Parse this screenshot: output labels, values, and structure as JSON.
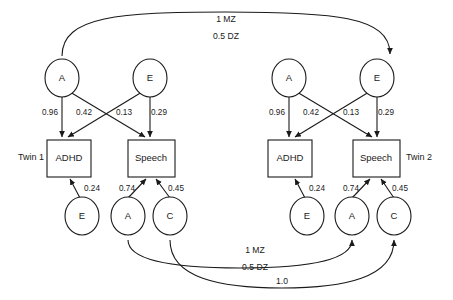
{
  "diagram": {
    "twins": [
      {
        "id": "twin1",
        "label": "Twin 1",
        "top_latents": [
          {
            "name": "A",
            "label": "A"
          },
          {
            "name": "E",
            "label": "E"
          }
        ],
        "observed": [
          {
            "name": "adhd",
            "label": "ADHD"
          },
          {
            "name": "speech",
            "label": "Speech"
          }
        ],
        "bottom_latents": [
          {
            "name": "E",
            "label": "E"
          },
          {
            "name": "A",
            "label": "A"
          },
          {
            "name": "C",
            "label": "C"
          }
        ],
        "top_paths": [
          {
            "from": "A",
            "to": "ADHD",
            "coefficient": "0.96"
          },
          {
            "from": "A",
            "to": "Speech",
            "coefficient": "0.42"
          },
          {
            "from": "E",
            "to": "ADHD",
            "coefficient": "0.13"
          },
          {
            "from": "E",
            "to": "Speech",
            "coefficient": "0.29"
          }
        ],
        "bottom_paths": [
          {
            "from": "E",
            "to": "ADHD",
            "coefficient": "0.24"
          },
          {
            "from": "A",
            "to": "Speech",
            "coefficient": "0.74"
          },
          {
            "from": "C",
            "to": "Speech",
            "coefficient": "0.45"
          }
        ]
      },
      {
        "id": "twin2",
        "label": "Twin 2",
        "top_latents": [
          {
            "name": "A",
            "label": "A"
          },
          {
            "name": "E",
            "label": "E"
          }
        ],
        "observed": [
          {
            "name": "adhd",
            "label": "ADHD"
          },
          {
            "name": "speech",
            "label": "Speech"
          }
        ],
        "bottom_latents": [
          {
            "name": "E",
            "label": "E"
          },
          {
            "name": "A",
            "label": "A"
          },
          {
            "name": "C",
            "label": "C"
          }
        ],
        "top_paths": [
          {
            "from": "A",
            "to": "ADHD",
            "coefficient": "0.96"
          },
          {
            "from": "A",
            "to": "Speech",
            "coefficient": "0.42"
          },
          {
            "from": "E",
            "to": "ADHD",
            "coefficient": "0.13"
          },
          {
            "from": "E",
            "to": "Speech",
            "coefficient": "0.29"
          }
        ],
        "bottom_paths": [
          {
            "from": "E",
            "to": "ADHD",
            "coefficient": "0.24"
          },
          {
            "from": "A",
            "to": "Speech",
            "coefficient": "0.74"
          },
          {
            "from": "C",
            "to": "Speech",
            "coefficient": "0.45"
          }
        ]
      }
    ],
    "correlations": [
      {
        "name": "top-a-correlation",
        "position": "top",
        "connects": "Twin 1 A (top) to Twin 2 A (top)",
        "labels": [
          "1 MZ",
          "0.5 DZ"
        ]
      },
      {
        "name": "bottom-a-correlation",
        "position": "bottom",
        "connects": "Twin 1 A (bottom) to Twin 2 A (bottom)",
        "labels": [
          "1 MZ",
          "0.5 DZ"
        ]
      },
      {
        "name": "bottom-c-correlation",
        "position": "bottom",
        "connects": "Twin 1 C (bottom) to Twin 2 C (bottom)",
        "labels": [
          "1.0"
        ]
      }
    ]
  },
  "colors": {
    "stroke": "#1a1a1a",
    "fill": "#ffffff",
    "background": "#ffffff"
  }
}
